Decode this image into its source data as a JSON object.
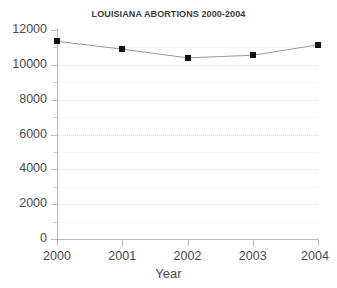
{
  "chart_data": {
    "type": "line",
    "title": "LOUISIANA ABORTIONS 2000-2004",
    "xlabel": "Year",
    "ylabel": "",
    "categories": [
      "2000",
      "2001",
      "2002",
      "2003",
      "2004"
    ],
    "values": [
      11350,
      10900,
      10400,
      10550,
      11150
    ],
    "series": [
      {
        "name": "Louisiana abortions",
        "values": [
          11350,
          10900,
          10400,
          10550,
          11150
        ]
      }
    ],
    "xlim": [
      2000,
      2004
    ],
    "ylim": [
      0,
      12000
    ],
    "yticks": [
      0,
      2000,
      4000,
      6000,
      8000,
      10000,
      12000
    ],
    "ytick_labels": [
      "0",
      "2000",
      "4000",
      "6000",
      "8000",
      "10000",
      "12000"
    ],
    "xticks": [
      2000,
      2001,
      2002,
      2003,
      2004
    ],
    "xtick_labels": [
      "2000",
      "2001",
      "2002",
      "2003",
      "2004"
    ],
    "grid": "horizontal-dotted",
    "legend": "none",
    "marker": "square",
    "marker_color": "#111111",
    "line_color": "#999999",
    "axis_color": "#b9b9b9",
    "grid_color": "#d8d8d8",
    "background": "#ffffff"
  },
  "axis": {
    "y_labels": [
      "12000",
      "10000",
      "8000",
      "6000",
      "4000",
      "2000",
      "0"
    ],
    "x_labels": [
      "2000",
      "2001",
      "2002",
      "2003",
      "2004"
    ],
    "x_title": "Year"
  }
}
